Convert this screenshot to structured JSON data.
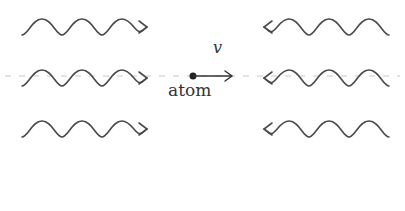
{
  "diagram": {
    "atom_label": "atom",
    "velocity_label": "v",
    "colors": {
      "stroke": "#4a4a4a",
      "axis": "#c8c8c8",
      "text": "#333333"
    },
    "left_waves": {
      "count": 3,
      "direction": "right",
      "rows_y": [
        25,
        76,
        127
      ]
    },
    "right_waves": {
      "count": 3,
      "direction": "left",
      "rows_y": [
        25,
        76,
        127
      ]
    },
    "atom": {
      "x": 193,
      "y": 76,
      "arrow_to_x": 233
    }
  }
}
